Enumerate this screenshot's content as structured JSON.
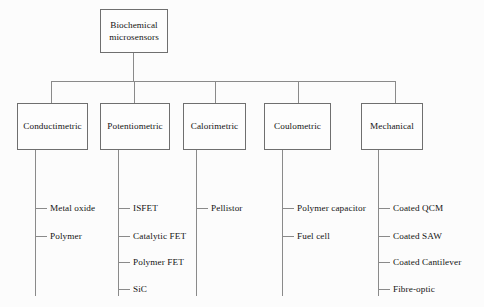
{
  "diagram": {
    "root": {
      "label": "Biochemical\nmicrosensors",
      "line1": "Biochemical",
      "line2": "microsensors"
    },
    "line_color": "#8a8a8a",
    "box_border_color": "#6f6f6f",
    "text_color": "#141414",
    "background_color": "#fcfcfc",
    "categories": [
      {
        "label": "Conductimetric",
        "leaves": [
          {
            "label": "Metal oxide"
          },
          {
            "label": "Polymer"
          }
        ]
      },
      {
        "label": "Potentiometric",
        "leaves": [
          {
            "label": "ISFET"
          },
          {
            "label": "Catalytic FET"
          },
          {
            "label": "Polymer FET"
          },
          {
            "label": "SiC"
          }
        ]
      },
      {
        "label": "Calorimetric",
        "leaves": [
          {
            "label": "Pellistor"
          }
        ]
      },
      {
        "label": "Coulometric",
        "leaves": [
          {
            "label": "Polymer capacitor"
          },
          {
            "label": "Fuel cell"
          }
        ]
      },
      {
        "label": "Mechanical",
        "leaves": [
          {
            "label": "Coated QCM"
          },
          {
            "label": "Coated SAW"
          },
          {
            "label": "Coated Cantilever"
          },
          {
            "label": "Fibre-optic"
          }
        ]
      }
    ]
  }
}
